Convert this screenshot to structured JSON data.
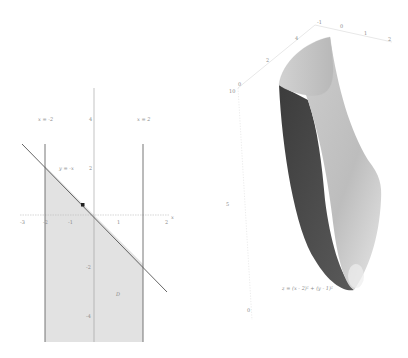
{
  "left_plot": {
    "x_ticks": [
      "-3",
      "-2",
      "-1",
      "1",
      "2"
    ],
    "y_ticks": [
      "4",
      "2",
      "-2",
      "-4"
    ],
    "x_axis_label": "x",
    "y_axis_label": "y",
    "line_left_label": "x = -2",
    "line_right_label": "x = 2",
    "diagonal_label": "y = -x",
    "region_label": "D",
    "colors": {
      "region": "#e0e0e0",
      "line": "#555555",
      "axis": "#bdbdbd",
      "point": "#222222"
    }
  },
  "right_plot": {
    "surface_label": "z = (x - 2)² + (y - 1)²",
    "top_axis_ticks": [
      "-1",
      "0",
      "1",
      "2"
    ],
    "left_axis_ticks": [
      "4",
      "2",
      "0"
    ],
    "vertical_axis_ticks": [
      "10",
      "5",
      "0"
    ],
    "colors": {
      "surface_light": "#c8c8c8",
      "surface_dark": "#4a4a4a",
      "axis": "#cfcfcf"
    }
  }
}
